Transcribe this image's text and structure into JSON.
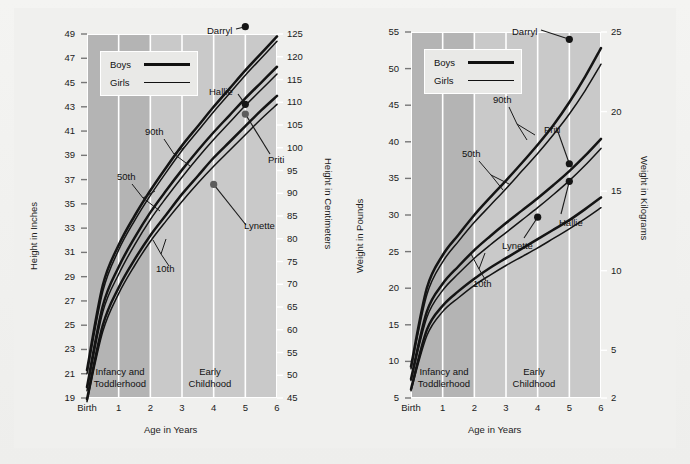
{
  "figure": {
    "background_color": "#f0f0ee",
    "plot_fill": "#c9c9c9",
    "band_fill": "#b4b4b4",
    "grid_color": "#ffffff",
    "curve_color": "#111111"
  },
  "charts": [
    {
      "id": "height-chart",
      "left_axis": {
        "title": "Height in Inches",
        "ticks": [
          "19",
          "21",
          "23",
          "25",
          "27",
          "29",
          "31",
          "33",
          "35",
          "37",
          "39",
          "41",
          "43",
          "45",
          "47",
          "49"
        ],
        "min": 19,
        "max": 49,
        "step": 2
      },
      "right_axis": {
        "title": "Height in Centimeters",
        "ticks": [
          "45",
          "50",
          "55",
          "60",
          "65",
          "70",
          "75",
          "80",
          "85",
          "90",
          "95",
          "100",
          "105",
          "110",
          "115",
          "120",
          "125"
        ],
        "min": 45,
        "max": 125,
        "step": 5
      },
      "x_axis": {
        "title": "Age in Years",
        "ticks": [
          "Birth",
          "1",
          "2",
          "3",
          "4",
          "5",
          "6"
        ],
        "min": 0,
        "max": 6
      },
      "legend": {
        "items": [
          {
            "label": "Boys",
            "line_width": 2.6
          },
          {
            "label": "Girls",
            "line_width": 1.6
          }
        ]
      },
      "stages": [
        {
          "label": "Infancy and\nToddlerhood",
          "line1": "Infancy and",
          "line2": "Toddlerhood",
          "from": 0,
          "to": 2
        },
        {
          "label": "Early\nChildhood",
          "line1": "Early",
          "line2": "Childhood",
          "from": 2,
          "to": 6
        }
      ],
      "percentile_labels": [
        {
          "text": "90th"
        },
        {
          "text": "50th"
        },
        {
          "text": "10th"
        }
      ],
      "points": [
        {
          "name": "Darryl",
          "sex": "boy",
          "age": 5,
          "value_in": 49.6,
          "marker": "dark"
        },
        {
          "name": "Hallie",
          "sex": "girl",
          "age": 5,
          "value_in": 43.2,
          "marker": "dark"
        },
        {
          "name": "Priti",
          "sex": "girl",
          "age": 5,
          "value_in": 42.4,
          "marker": "light"
        },
        {
          "name": "Lynette",
          "sex": "girl",
          "age": 4,
          "value_in": 36.6,
          "marker": "light"
        }
      ]
    },
    {
      "id": "weight-chart",
      "left_axis": {
        "title": "Weight in Pounds",
        "ticks": [
          "5",
          "10",
          "15",
          "20",
          "25",
          "30",
          "35",
          "40",
          "45",
          "50",
          "55"
        ],
        "min": 5,
        "max": 55,
        "step": 5
      },
      "right_axis": {
        "title": "Weight in Kilograms",
        "ticks": [
          "2",
          "5",
          "10",
          "15",
          "20",
          "25"
        ],
        "min": 2,
        "max": 25
      },
      "x_axis": {
        "title": "Age in Years",
        "ticks": [
          "Birth",
          "1",
          "2",
          "3",
          "4",
          "5",
          "6"
        ],
        "min": 0,
        "max": 6
      },
      "legend": {
        "items": [
          {
            "label": "Boys",
            "line_width": 2.6
          },
          {
            "label": "Girls",
            "line_width": 1.6
          }
        ]
      },
      "stages": [
        {
          "label": "Infancy and\nToddlerhood",
          "line1": "Infancy and",
          "line2": "Toddlerhood",
          "from": 0,
          "to": 2
        },
        {
          "label": "Early\nChildhood",
          "line1": "Early",
          "line2": "Childhood",
          "from": 2,
          "to": 6
        }
      ],
      "percentile_labels": [
        {
          "text": "90th"
        },
        {
          "text": "50th"
        },
        {
          "text": "10th"
        }
      ],
      "points": [
        {
          "name": "Darryl",
          "sex": "boy",
          "age": 5,
          "value_lb": 54.0,
          "marker": "dark"
        },
        {
          "name": "Priti",
          "sex": "girl",
          "age": 5,
          "value_lb": 37.0,
          "marker": "dark"
        },
        {
          "name": "Hallie",
          "sex": "girl",
          "age": 5,
          "value_lb": 34.6,
          "marker": "dark"
        },
        {
          "name": "Lynette",
          "sex": "girl",
          "age": 4,
          "value_lb": 29.7,
          "marker": "dark"
        }
      ]
    }
  ],
  "chart_data": [
    {
      "type": "line",
      "title": "Height for Age",
      "xlabel": "Age in Years",
      "ylabel": "Height in Inches",
      "ylabel_secondary": "Height in Centimeters",
      "x": [
        0,
        0.5,
        1,
        1.5,
        2,
        2.5,
        3,
        3.5,
        4,
        4.5,
        5,
        5.5,
        6
      ],
      "xticklabels": [
        "Birth",
        "1",
        "2",
        "3",
        "4",
        "5",
        "6"
      ],
      "ylim": [
        19,
        49
      ],
      "ylim_secondary": [
        45,
        125
      ],
      "grid": true,
      "legend": [
        "Boys",
        "Girls"
      ],
      "legend_position": "upper-left",
      "series": [
        {
          "name": "Boys 90th",
          "percentile": 90,
          "sex": "boy",
          "values": [
            21.3,
            28.3,
            31.6,
            34.0,
            36.1,
            38.0,
            39.8,
            41.4,
            43.0,
            44.5,
            46.0,
            47.4,
            48.8
          ]
        },
        {
          "name": "Girls 90th",
          "percentile": 90,
          "sex": "girl",
          "values": [
            21.0,
            27.8,
            31.2,
            33.6,
            35.7,
            37.6,
            39.4,
            41.0,
            42.6,
            44.1,
            45.6,
            47.0,
            48.4
          ]
        },
        {
          "name": "Boys 50th",
          "percentile": 50,
          "sex": "boy",
          "values": [
            19.9,
            26.6,
            29.8,
            32.2,
            34.3,
            36.1,
            37.8,
            39.4,
            40.9,
            42.3,
            43.7,
            45.0,
            46.3
          ]
        },
        {
          "name": "Girls 50th",
          "percentile": 50,
          "sex": "girl",
          "values": [
            19.6,
            26.1,
            29.2,
            31.6,
            33.7,
            35.5,
            37.2,
            38.8,
            40.3,
            41.7,
            43.1,
            44.4,
            45.7
          ]
        },
        {
          "name": "Boys 10th",
          "percentile": 10,
          "sex": "boy",
          "values": [
            18.9,
            25.0,
            28.1,
            30.4,
            32.4,
            34.1,
            35.8,
            37.3,
            38.8,
            40.1,
            41.4,
            42.7,
            43.9
          ]
        },
        {
          "name": "Girls 10th",
          "percentile": 10,
          "sex": "girl",
          "values": [
            18.7,
            24.5,
            27.6,
            29.9,
            31.9,
            33.6,
            35.2,
            36.7,
            38.1,
            39.4,
            40.7,
            42.0,
            43.2
          ]
        }
      ],
      "annotations": [
        {
          "text": "90th"
        },
        {
          "text": "50th"
        },
        {
          "text": "10th"
        },
        {
          "text": "Darryl",
          "x": 5,
          "y": 49.6
        },
        {
          "text": "Hallie",
          "x": 5,
          "y": 43.2
        },
        {
          "text": "Priti",
          "x": 5,
          "y": 42.4
        },
        {
          "text": "Lynette",
          "x": 4,
          "y": 36.6
        },
        {
          "text": "Infancy and Toddlerhood"
        },
        {
          "text": "Early Childhood"
        }
      ]
    },
    {
      "type": "line",
      "title": "Weight for Age",
      "xlabel": "Age in Years",
      "ylabel": "Weight in Pounds",
      "ylabel_secondary": "Weight in Kilograms",
      "x": [
        0,
        0.5,
        1,
        1.5,
        2,
        2.5,
        3,
        3.5,
        4,
        4.5,
        5,
        5.5,
        6
      ],
      "xticklabels": [
        "Birth",
        "1",
        "2",
        "3",
        "4",
        "5",
        "6"
      ],
      "ylim": [
        5,
        55
      ],
      "ylim_secondary": [
        2,
        25
      ],
      "grid": true,
      "legend": [
        "Boys",
        "Girls"
      ],
      "legend_position": "upper-left",
      "series": [
        {
          "name": "Boys 90th",
          "percentile": 90,
          "sex": "boy",
          "values": [
            9.3,
            20.0,
            24.5,
            27.3,
            30.0,
            32.4,
            34.7,
            37.1,
            39.6,
            42.3,
            45.4,
            48.9,
            52.8
          ]
        },
        {
          "name": "Girls 90th",
          "percentile": 90,
          "sex": "girl",
          "values": [
            9.0,
            19.1,
            23.6,
            26.4,
            29.0,
            31.3,
            33.6,
            36.0,
            38.4,
            41.0,
            43.8,
            47.0,
            50.6
          ]
        },
        {
          "name": "Boys 50th",
          "percentile": 50,
          "sex": "boy",
          "values": [
            7.6,
            16.8,
            20.6,
            23.0,
            25.2,
            27.1,
            28.9,
            30.6,
            32.3,
            34.1,
            36.0,
            38.1,
            40.4
          ]
        },
        {
          "name": "Girls 50th",
          "percentile": 50,
          "sex": "girl",
          "values": [
            7.4,
            16.0,
            19.7,
            22.0,
            24.1,
            25.9,
            27.6,
            29.3,
            31.0,
            32.8,
            34.7,
            36.8,
            39.1
          ]
        },
        {
          "name": "Boys 10th",
          "percentile": 10,
          "sex": "boy",
          "values": [
            6.2,
            14.3,
            17.6,
            19.6,
            21.3,
            22.8,
            24.1,
            25.4,
            26.7,
            28.0,
            29.3,
            30.8,
            32.4
          ]
        },
        {
          "name": "Girls 10th",
          "percentile": 10,
          "sex": "girl",
          "values": [
            6.0,
            13.5,
            16.8,
            18.7,
            20.4,
            21.8,
            23.1,
            24.3,
            25.5,
            26.8,
            28.1,
            29.5,
            31.0
          ]
        }
      ],
      "annotations": [
        {
          "text": "90th"
        },
        {
          "text": "50th"
        },
        {
          "text": "10th"
        },
        {
          "text": "Darryl",
          "x": 5,
          "y": 54.0
        },
        {
          "text": "Priti",
          "x": 5,
          "y": 37.0
        },
        {
          "text": "Hallie",
          "x": 5,
          "y": 34.6
        },
        {
          "text": "Lynette",
          "x": 4,
          "y": 29.7
        },
        {
          "text": "Infancy and Toddlerhood"
        },
        {
          "text": "Early Childhood"
        }
      ]
    }
  ]
}
